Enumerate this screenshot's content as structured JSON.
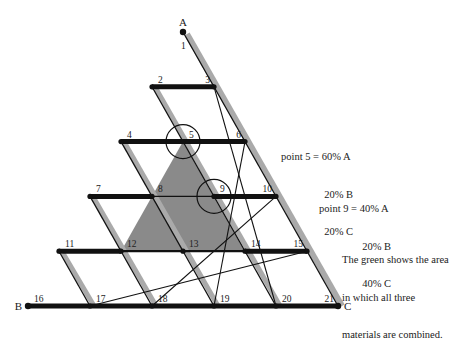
{
  "diagram": {
    "corners": {
      "A": "A",
      "B": "B",
      "C": "C"
    },
    "point_labels": [
      "1",
      "2",
      "3",
      "4",
      "5",
      "6",
      "7",
      "8",
      "9",
      "10",
      "11",
      "12",
      "13",
      "14",
      "15",
      "16",
      "17",
      "18",
      "19",
      "20",
      "21"
    ],
    "highlighted_points": [
      "5",
      "9"
    ],
    "shaded_region": {
      "vertices": [
        "5",
        "12",
        "14"
      ],
      "color": "#8a8a8a"
    }
  },
  "annotations": {
    "point5": {
      "line1": "point 5 = 60% A",
      "line2": "20% B",
      "line3": "20% C"
    },
    "point9": {
      "line1": "point 9 = 40% A",
      "line2": "20% B",
      "line3": "40% C"
    },
    "caption": {
      "line1": "The green shows the area",
      "line2": "in which all three",
      "line3": "materials are combined."
    }
  },
  "colors": {
    "line": "#111111",
    "shadow": "#aaaaaa",
    "shade": "#8a8a8a"
  }
}
